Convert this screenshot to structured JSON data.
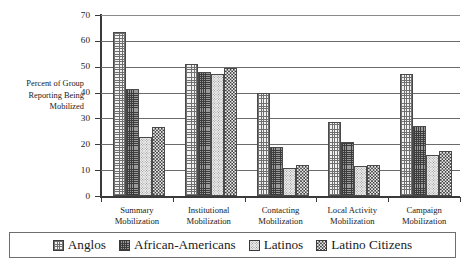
{
  "chart_data": {
    "type": "bar",
    "title": "",
    "xlabel": "",
    "ylabel": "Percent of Group Reporting Being Mobilized",
    "ylabel_lines": [
      "Percent of Group",
      "Reporting Being",
      "Mobilized"
    ],
    "ylim": [
      0,
      70
    ],
    "yticks": [
      0,
      10,
      20,
      30,
      40,
      50,
      60,
      70
    ],
    "ytick_labels": [
      "0",
      "10",
      "20",
      "30",
      "40",
      "50",
      "60",
      "70"
    ],
    "grid": true,
    "legend_position": "bottom",
    "categories": [
      "Summary Mobilization",
      "Institutional Mobilization",
      "Contacting Mobilization",
      "Local Activity Mobilization",
      "Campaign Mobilization"
    ],
    "category_lines": [
      [
        "Summary",
        "Mobilization"
      ],
      [
        "Institutional",
        "Mobilization"
      ],
      [
        "Contacting",
        "Mobilization"
      ],
      [
        "Local Activity",
        "Mobilization"
      ],
      [
        "Campaign",
        "Mobilization"
      ]
    ],
    "series": [
      {
        "name": "Anglos",
        "pattern": "grid-cross",
        "values": [
          63.5,
          51.0,
          40.0,
          28.5,
          47.0
        ]
      },
      {
        "name": "African-Americans",
        "pattern": "dense-cross",
        "values": [
          41.5,
          48.0,
          19.0,
          21.0,
          27.0
        ]
      },
      {
        "name": "Latinos",
        "pattern": "light-dots",
        "values": [
          23.0,
          47.0,
          11.0,
          11.5,
          16.0
        ]
      },
      {
        "name": "Latino Citizens",
        "pattern": "checkerboard",
        "values": [
          26.5,
          49.5,
          12.0,
          12.0,
          17.5
        ]
      }
    ]
  },
  "legend": {
    "items": [
      {
        "label": "Anglos"
      },
      {
        "label": "African-Americans"
      },
      {
        "label": "Latinos"
      },
      {
        "label": "Latino Citizens"
      }
    ]
  }
}
